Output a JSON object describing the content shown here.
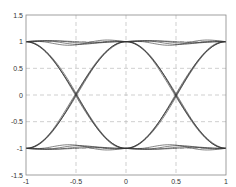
{
  "chart_data": {
    "type": "line",
    "title": "",
    "xlabel": "",
    "ylabel": "",
    "xlim": [
      -1,
      1
    ],
    "ylim": [
      -1.5,
      1.5
    ],
    "grid": true,
    "legend": null,
    "x_ticks": [
      -1,
      -0.5,
      0,
      0.5,
      1
    ],
    "x_tick_labels": [
      "-1",
      "-0.5",
      "0",
      "0.5",
      "1"
    ],
    "y_ticks": [
      -1.5,
      -1,
      -0.5,
      0,
      0.5,
      1,
      1.5
    ],
    "y_tick_labels": [
      "-1.5",
      "-1",
      "-0.5",
      "0",
      "0.5",
      "1",
      "1.5"
    ],
    "crossings": [
      {
        "x": -0.5,
        "y": 0
      },
      {
        "x": 0.5,
        "y": 0
      }
    ],
    "levels": [
      1,
      -1
    ],
    "num_traces": 8,
    "series": [
      {
        "name": "trace-rise-a",
        "x": [
          -1,
          -0.75,
          -0.5,
          -0.25,
          0,
          0.25,
          0.5,
          0.75,
          1
        ],
        "values": [
          -1,
          -0.72,
          0,
          0.72,
          1,
          0.72,
          0,
          -0.72,
          -1
        ]
      },
      {
        "name": "trace-fall-a",
        "x": [
          -1,
          -0.75,
          -0.5,
          -0.25,
          0,
          0.25,
          0.5,
          0.75,
          1
        ],
        "values": [
          1,
          0.72,
          0,
          -0.72,
          -1,
          -0.72,
          0,
          0.72,
          1
        ]
      },
      {
        "name": "trace-high",
        "x": [
          -1,
          -0.75,
          -0.5,
          -0.25,
          0,
          0.25,
          0.5,
          0.75,
          1
        ],
        "values": [
          1,
          1.04,
          1.0,
          0.97,
          1,
          1.03,
          1.0,
          0.98,
          1
        ]
      },
      {
        "name": "trace-low",
        "x": [
          -1,
          -0.75,
          -0.5,
          -0.25,
          0,
          0.25,
          0.5,
          0.75,
          1
        ],
        "values": [
          -1,
          -1.04,
          -1.0,
          -0.97,
          -1,
          -1.03,
          -1.0,
          -0.98,
          -1
        ]
      }
    ]
  },
  "colors": {
    "trace": "#333333",
    "grid": "#b0b0b0",
    "axes": "#888888",
    "background": "#ffffff"
  }
}
